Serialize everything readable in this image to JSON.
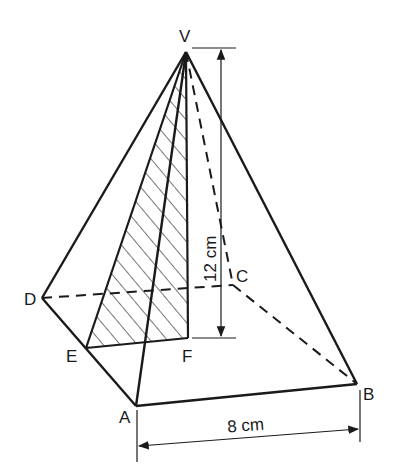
{
  "diagram": {
    "type": "square-based pyramid",
    "vertices": {
      "V": {
        "label": "V",
        "x": 186,
        "y": 52
      },
      "A": {
        "label": "A",
        "x": 136,
        "y": 406
      },
      "B": {
        "label": "B",
        "x": 357,
        "y": 384
      },
      "C": {
        "label": "C",
        "x": 233,
        "y": 285
      },
      "D": {
        "label": "D",
        "x": 42,
        "y": 298
      },
      "E": {
        "label": "E",
        "x": 86,
        "y": 348
      },
      "F": {
        "label": "F",
        "x": 188,
        "y": 338
      }
    },
    "dimensions": {
      "height": "12 cm",
      "base_edge": "8 cm"
    },
    "shaded_region": "triangle VEF (hatched)",
    "colors": {
      "line": "#1a1a1a",
      "background": "#ffffff"
    }
  }
}
